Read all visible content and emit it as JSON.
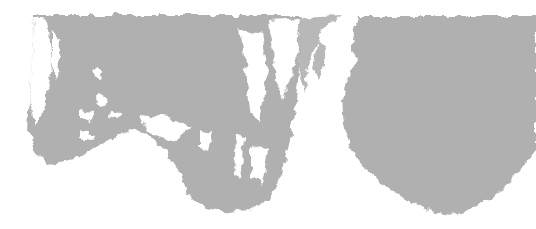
{
  "image": {
    "description": "Abstract gray brush/ink texture on white background",
    "colors": {
      "background": "#ffffff",
      "ink": "#b0b0b0",
      "ink_dark": "#a8a8a8"
    },
    "shapes": [
      {
        "name": "left-ink-blob"
      },
      {
        "name": "right-ink-blob"
      }
    ]
  }
}
